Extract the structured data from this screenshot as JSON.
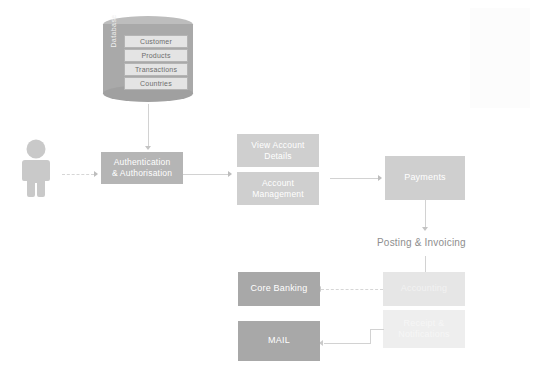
{
  "diagram": {
    "database": {
      "side_label": "Database",
      "rows": [
        {
          "label": "Customer"
        },
        {
          "label": "Products"
        },
        {
          "label": "Transactions"
        },
        {
          "label": "Countries"
        }
      ]
    },
    "actor": {
      "name": "user-actor",
      "icon": "person-icon"
    },
    "nodes": [
      {
        "id": "authentication",
        "label": "Authentication\n& Authorisation",
        "line1": "Authentication",
        "line2": "& Authorisation",
        "color": "#b5b5b5"
      },
      {
        "id": "view-account-details",
        "label": "View Account\nDetails",
        "line1": "View Account",
        "line2": "Details",
        "color": "#cfcfcf"
      },
      {
        "id": "account-management",
        "label": "Account\nManagement",
        "line1": "Account",
        "line2": "Management",
        "color": "#cfcfcf"
      },
      {
        "id": "payments",
        "label": "Payments",
        "line1": "Payments",
        "line2": "",
        "color": "#cfcfcf"
      },
      {
        "id": "accounting",
        "label": "Accounting",
        "line1": "Accounting",
        "line2": "",
        "color": "#e6e6e6"
      },
      {
        "id": "core-banking",
        "label": "Core Banking",
        "line1": "Core Banking",
        "line2": "",
        "color": "#a8a8a8"
      },
      {
        "id": "receipt-notifications",
        "label": "Receipt &\nNotifications",
        "line1": "Receipt &",
        "line2": "Notifications",
        "color": "#eeeeee"
      },
      {
        "id": "mail",
        "label": "MAIL",
        "line1": "MAIL",
        "line2": "",
        "color": "#a8a8a8"
      }
    ],
    "captions": [
      {
        "id": "posting-invoicing",
        "text": "Posting & Invoicing"
      }
    ]
  }
}
